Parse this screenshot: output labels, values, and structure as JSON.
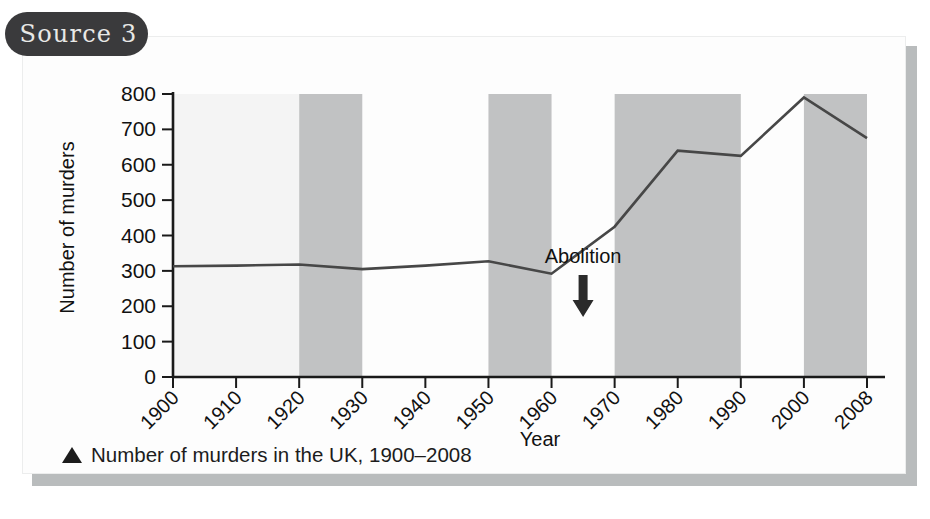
{
  "badge": {
    "label": "Source 3"
  },
  "caption": {
    "marker_icon": "triangle-up-icon",
    "text": "Number of murders in the UK, 1900–2008"
  },
  "colors": {
    "badge_bg": "#3a3a3c",
    "badge_text": "#e8e8e6",
    "card_bg": "#fdfdfd",
    "card_shadow": "#b9bcbd",
    "band": "#c1c2c3",
    "band_light": "#f4f4f4",
    "line": "#474747",
    "axis": "#1a1a1a",
    "text": "#111111"
  },
  "chart_data": {
    "type": "line",
    "title": "",
    "xlabel": "Year",
    "ylabel": "Number of murders",
    "x": [
      1900,
      1910,
      1920,
      1930,
      1940,
      1950,
      1960,
      1970,
      1980,
      1990,
      2000,
      2008
    ],
    "xtick_labels": [
      "1900",
      "1910",
      "1920",
      "1930",
      "1940",
      "1950",
      "1960",
      "1970",
      "1980",
      "1990",
      "2000",
      "2008"
    ],
    "values": [
      313,
      315,
      318,
      305,
      315,
      327,
      292,
      425,
      640,
      625,
      790,
      675
    ],
    "ytick_labels": [
      "0",
      "100",
      "200",
      "300",
      "400",
      "500",
      "600",
      "700",
      "800"
    ],
    "yticks": [
      0,
      100,
      200,
      300,
      400,
      500,
      600,
      700,
      800
    ],
    "ylim": [
      0,
      800
    ],
    "xlim": [
      1900,
      2008
    ],
    "grid": false,
    "legend": "none",
    "shaded_bands": [
      {
        "from": 1900,
        "to": 1920,
        "shade": "light"
      },
      {
        "from": 1920,
        "to": 1930,
        "shade": "dark"
      },
      {
        "from": 1950,
        "to": 1960,
        "shade": "dark"
      },
      {
        "from": 1970,
        "to": 1990,
        "shade": "dark"
      },
      {
        "from": 2000,
        "to": 2008,
        "shade": "dark"
      }
    ],
    "annotations": [
      {
        "text": "Abolition",
        "at_x": 1965,
        "at_y": 430,
        "marker": "down-arrow"
      }
    ]
  }
}
